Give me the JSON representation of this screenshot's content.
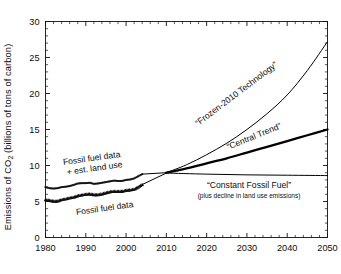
{
  "chart_data": {
    "type": "line",
    "title": "",
    "xlabel": "",
    "ylabel": "Emissions of CO2 (billions of tons of carbon)",
    "ylabel_prefix": "Emissions of CO",
    "ylabel_sub": "2",
    "ylabel_suffix": " (billions of tons of carbon)",
    "xlim": [
      1980,
      2050
    ],
    "ylim": [
      0,
      30
    ],
    "xticks": [
      1980,
      1990,
      2000,
      2010,
      2020,
      2030,
      2040,
      2050
    ],
    "xtick_labels": [
      "1980",
      "1990",
      "2000",
      "2010",
      "2020",
      "2030",
      "2040",
      "2050"
    ],
    "yticks": [
      0,
      5,
      10,
      15,
      20,
      25,
      30
    ],
    "ytick_labels": [
      "0",
      "5",
      "10",
      "15",
      "20",
      "25",
      "30"
    ],
    "grid": false,
    "legend_position": "inline-annotations",
    "line_color": "#000000",
    "series": [
      {
        "name": "Fossil fuel data + est. land use",
        "marker": "square-dot",
        "style": "dotted-markers",
        "x": [
          1980,
          1981,
          1982,
          1983,
          1984,
          1985,
          1986,
          1987,
          1988,
          1989,
          1990,
          1991,
          1992,
          1993,
          1994,
          1995,
          1996,
          1997,
          1998,
          1999,
          2000,
          2001,
          2002,
          2003,
          2004
        ],
        "values": [
          7.0,
          6.85,
          6.8,
          6.85,
          7.0,
          7.05,
          7.15,
          7.3,
          7.5,
          7.55,
          7.55,
          7.6,
          7.45,
          7.5,
          7.6,
          7.7,
          7.8,
          7.9,
          7.85,
          7.85,
          8.0,
          8.05,
          8.2,
          8.5,
          8.8
        ]
      },
      {
        "name": "Fossil fuel data",
        "marker": "triangle",
        "style": "dotted-markers",
        "x": [
          1980,
          1981,
          1982,
          1983,
          1984,
          1985,
          1986,
          1987,
          1988,
          1989,
          1990,
          1991,
          1992,
          1993,
          1994,
          1995,
          1996,
          1997,
          1998,
          1999,
          2000,
          2001,
          2002,
          2003,
          2004
        ],
        "values": [
          5.25,
          5.15,
          5.05,
          5.05,
          5.25,
          5.35,
          5.5,
          5.6,
          5.8,
          5.9,
          6.0,
          6.05,
          5.95,
          5.95,
          6.05,
          6.2,
          6.35,
          6.4,
          6.4,
          6.4,
          6.55,
          6.6,
          6.7,
          7.0,
          7.35
        ]
      },
      {
        "name": "“Frozen-2010 Technology”",
        "marker": "none",
        "style": "thin-curve",
        "x": [
          2010,
          2015,
          2020,
          2025,
          2030,
          2035,
          2040,
          2045,
          2050
        ],
        "values": [
          9.0,
          10.1,
          11.5,
          13.1,
          15.0,
          17.2,
          19.8,
          23.2,
          27.2
        ]
      },
      {
        "name": "“Central Trend”",
        "marker": "none",
        "style": "thick-curve",
        "x": [
          2010,
          2015,
          2020,
          2025,
          2030,
          2035,
          2040,
          2045,
          2050
        ],
        "values": [
          9.0,
          9.6,
          10.3,
          11.0,
          11.8,
          12.6,
          13.4,
          14.2,
          15.0
        ]
      },
      {
        "name": "“Constant Fossil Fuel”",
        "marker": "none",
        "style": "thin-flat",
        "x": [
          2010,
          2020,
          2030,
          2040,
          2050
        ],
        "values": [
          8.95,
          8.8,
          8.7,
          8.65,
          8.6
        ]
      }
    ],
    "annotations": [
      {
        "id": "frozen-2010-technology",
        "text": "“Frozen-2010 Technology”"
      },
      {
        "id": "central-trend",
        "text": "“Central Trend”"
      },
      {
        "id": "constant-fossil-fuel",
        "text": "“Constant Fossil Fuel”"
      },
      {
        "id": "constant-fossil-fuel-sub",
        "text": "(plus decline in land use emissions)"
      },
      {
        "id": "fossil-fuel-plus-land-line1",
        "text": "Fossil fuel data"
      },
      {
        "id": "fossil-fuel-plus-land-line2",
        "text": "+ est. land use"
      },
      {
        "id": "fossil-fuel-data",
        "text": "Fossil fuel data"
      }
    ]
  }
}
